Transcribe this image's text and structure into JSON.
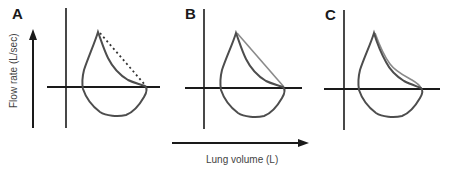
{
  "figure": {
    "panels": [
      {
        "label": "A",
        "envelope_style": "dashed",
        "description": "Flow-volume loop with concave expiratory limb; dashed line marks expected normal envelope"
      },
      {
        "label": "B",
        "envelope_style": "solid-gray",
        "description": "Flow-volume loop with concave expiratory limb; gray line marks larger envelope"
      },
      {
        "label": "C",
        "envelope_style": "solid-gray",
        "description": "Flow-volume loop with expiratory limb close to envelope"
      }
    ],
    "y_axis_label": "Flow rate (L/sec)",
    "x_axis_label": "Lung volume (L)"
  },
  "colors": {
    "axis": "#1a1a1a",
    "loop": "#4d4d4d",
    "envelope": "#8a8a8a",
    "dashed": "#333333",
    "text": "#444444"
  }
}
